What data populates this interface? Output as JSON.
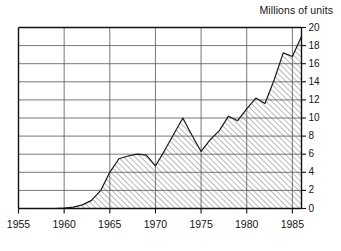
{
  "chart_data": {
    "type": "area",
    "title": "",
    "axis_title": "Millions of units",
    "xlabel": "",
    "ylabel": "Millions of units",
    "xlim": [
      1955,
      1986
    ],
    "ylim": [
      0,
      20
    ],
    "grid": true,
    "legend_position": "none",
    "y_axis_side": "right",
    "fill_pattern": "diagonal-hatch",
    "xticks": [
      1955,
      1960,
      1965,
      1970,
      1975,
      1980,
      1985
    ],
    "xtick_labels": [
      "1955",
      "1960",
      "1965",
      "1970",
      "1975",
      "1980",
      "1985"
    ],
    "yticks": [
      0,
      2,
      4,
      6,
      8,
      10,
      12,
      14,
      16,
      18,
      20
    ],
    "ytick_labels": [
      "0",
      "2",
      "4",
      "6",
      "8",
      "10",
      "12",
      "14",
      "16",
      "18",
      "20"
    ],
    "x": [
      1955,
      1956,
      1957,
      1958,
      1959,
      1960,
      1961,
      1962,
      1963,
      1964,
      1965,
      1966,
      1967,
      1968,
      1969,
      1970,
      1971,
      1972,
      1973,
      1974,
      1975,
      1976,
      1977,
      1978,
      1979,
      1980,
      1981,
      1982,
      1983,
      1984,
      1985,
      1986
    ],
    "values": [
      0.0,
      0.0,
      0.0,
      0.0,
      0.0,
      0.05,
      0.15,
      0.4,
      0.9,
      2.0,
      4.0,
      5.5,
      5.8,
      6.0,
      5.9,
      4.7,
      6.4,
      8.2,
      10.0,
      8.1,
      6.3,
      7.6,
      8.6,
      10.2,
      9.7,
      11.0,
      12.2,
      11.6,
      14.2,
      17.2,
      16.8,
      19.0
    ],
    "series_name": "Units"
  }
}
